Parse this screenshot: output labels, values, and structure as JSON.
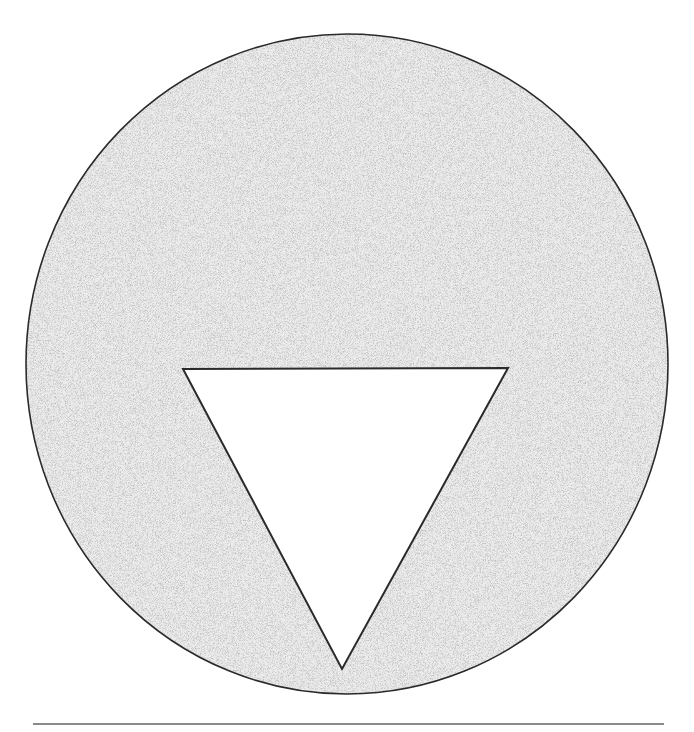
{
  "figure": {
    "circle": {
      "cx": 347,
      "cy": 364,
      "rx": 321,
      "ry": 330,
      "fill": "#dcdcdc",
      "stroke": "#2a2a2a"
    },
    "triangle": {
      "points": [
        [
          183,
          369
        ],
        [
          508,
          368
        ],
        [
          342,
          669
        ]
      ],
      "fill": "#ffffff",
      "stroke": "#2a2a2a",
      "orientation": "point-down"
    }
  },
  "separator": {
    "color": "#8a8a8a"
  },
  "caption": {
    "visible": "clipped"
  }
}
